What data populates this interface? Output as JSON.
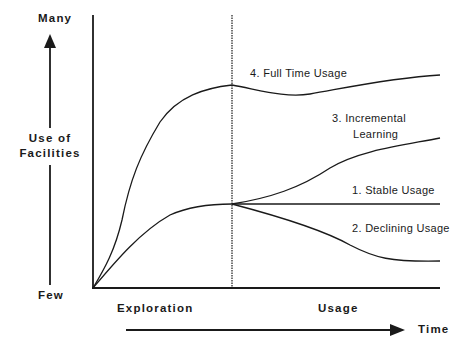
{
  "y_axis": {
    "top_label": "Many",
    "bottom_label": "Few",
    "title_line1": "Use of",
    "title_line2": "Facilities"
  },
  "x_axis": {
    "phase_left": "Exploration",
    "phase_right": "Usage",
    "arrow_label": "Time"
  },
  "curves": [
    {
      "id": 1,
      "label": "1. Stable Usage"
    },
    {
      "id": 2,
      "label": "2. Declining Usage"
    },
    {
      "id": 3,
      "label_line1": "3.  Incremental",
      "label_line2": "Learning"
    },
    {
      "id": 4,
      "label": "4. Full Time Usage"
    }
  ],
  "colors": {
    "ink": "#1a1a1a",
    "background": "#ffffff"
  }
}
